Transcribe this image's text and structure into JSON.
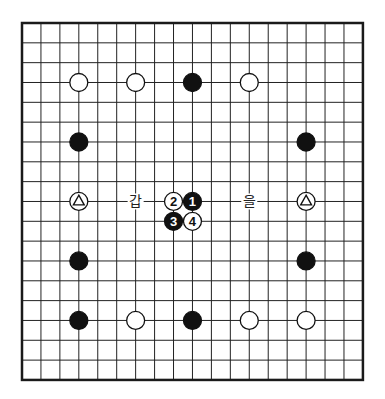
{
  "board": {
    "size": 19,
    "origin_x": 22,
    "origin_y": 23,
    "cell_w": 18.94,
    "cell_h": 19.83,
    "line_color": "#222222",
    "border_color": "#1a1a1a",
    "background": "#ffffff"
  },
  "stones": [
    {
      "col": 3,
      "row": 3,
      "color": "white"
    },
    {
      "col": 6,
      "row": 3,
      "color": "white"
    },
    {
      "col": 9,
      "row": 3,
      "color": "black"
    },
    {
      "col": 12,
      "row": 3,
      "color": "white"
    },
    {
      "col": 3,
      "row": 6,
      "color": "black"
    },
    {
      "col": 15,
      "row": 6,
      "color": "black"
    },
    {
      "col": 3,
      "row": 9,
      "color": "white",
      "mark": "triangle"
    },
    {
      "col": 15,
      "row": 9,
      "color": "white",
      "mark": "triangle"
    },
    {
      "col": 9,
      "row": 9,
      "color": "black",
      "label": "1"
    },
    {
      "col": 8,
      "row": 9,
      "color": "white",
      "label": "2"
    },
    {
      "col": 8,
      "row": 10,
      "color": "black",
      "label": "3"
    },
    {
      "col": 9,
      "row": 10,
      "color": "white",
      "label": "4"
    },
    {
      "col": 3,
      "row": 12,
      "color": "black"
    },
    {
      "col": 15,
      "row": 12,
      "color": "black"
    },
    {
      "col": 3,
      "row": 15,
      "color": "black"
    },
    {
      "col": 6,
      "row": 15,
      "color": "white"
    },
    {
      "col": 9,
      "row": 15,
      "color": "black"
    },
    {
      "col": 12,
      "row": 15,
      "color": "white"
    },
    {
      "col": 15,
      "row": 15,
      "color": "white"
    }
  ],
  "labels": [
    {
      "col": 6,
      "row": 9,
      "text": "갑"
    },
    {
      "col": 12,
      "row": 9,
      "text": "을"
    }
  ]
}
